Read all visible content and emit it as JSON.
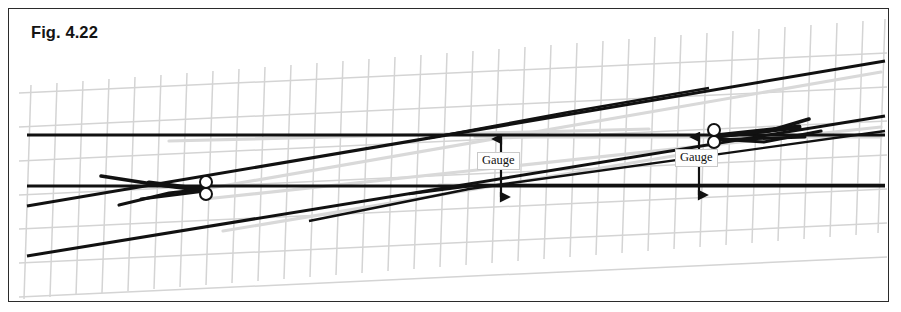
{
  "figure": {
    "label": "Fig. 4.22",
    "frame": {
      "border_color": "#2b2b2b",
      "background": "#ffffff"
    }
  },
  "annotations": {
    "gauge_left": {
      "label": "Gauge",
      "x": 468,
      "y": 143
    },
    "gauge_right": {
      "label": "Gauge",
      "x": 666,
      "y": 140
    }
  },
  "colors": {
    "rail": "#111111",
    "sleeper_grid": "#d4d4d4",
    "ghost_rail": "#d9d9d9",
    "label_border": "#c9c9c9",
    "frame_border": "#2b2b2b",
    "text": "#141414"
  },
  "geometry": {
    "sleeper_grid": {
      "long_line_count": 7,
      "cross_tie_count": 34,
      "tilt_deg": -6.5
    },
    "rails": [
      {
        "name": "main-rail-upper",
        "x1": 18,
        "y1": 126,
        "x2": 875,
        "y2": 126
      },
      {
        "name": "main-rail-lower",
        "x1": 18,
        "y1": 177,
        "x2": 875,
        "y2": 177
      },
      {
        "name": "diverging-rail-upper-right",
        "x1": 18,
        "y1": 197,
        "x2": 875,
        "y2": 52
      },
      {
        "name": "diverging-rail-lower-right",
        "x1": 18,
        "y1": 247,
        "x2": 875,
        "y2": 107
      }
    ],
    "switch_points": [
      {
        "name": "switch-point-left",
        "cx": 196,
        "cy": 180
      },
      {
        "name": "switch-point-right",
        "cx": 706,
        "cy": 128
      }
    ],
    "gauge_arrows": [
      {
        "name": "gauge-arrow-left",
        "x": 492,
        "y_top": 128,
        "y_bottom": 190
      },
      {
        "name": "gauge-arrow-right",
        "x": 691,
        "y_top": 126,
        "y_bottom": 188
      }
    ]
  }
}
